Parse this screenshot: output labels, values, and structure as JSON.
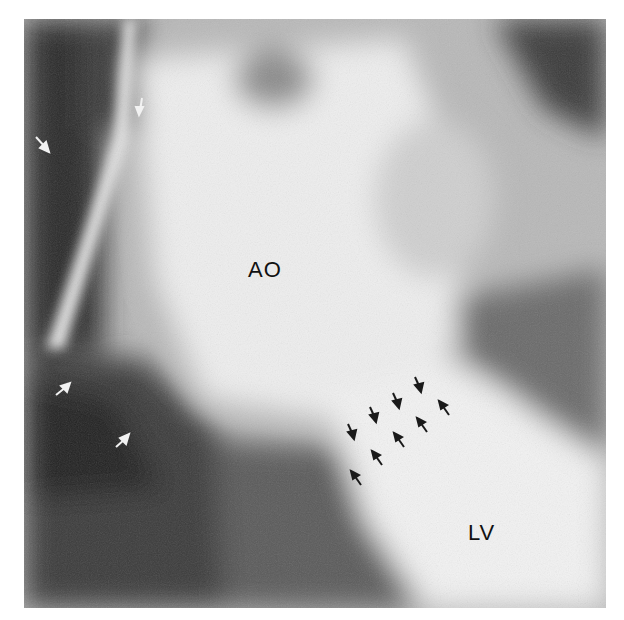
{
  "figure": {
    "labels": [
      {
        "id": "ao",
        "text": "AO",
        "meaning": "aorta"
      },
      {
        "id": "lv",
        "text": "LV",
        "meaning": "left ventricle"
      }
    ],
    "annotations": {
      "white_arrows": 5,
      "black_arrows": 10
    },
    "colors": {
      "background": "#ffffff",
      "white_arrow": "#f2f2f2",
      "black_arrow": "#1a1a1a",
      "label_text": "#111111"
    }
  }
}
